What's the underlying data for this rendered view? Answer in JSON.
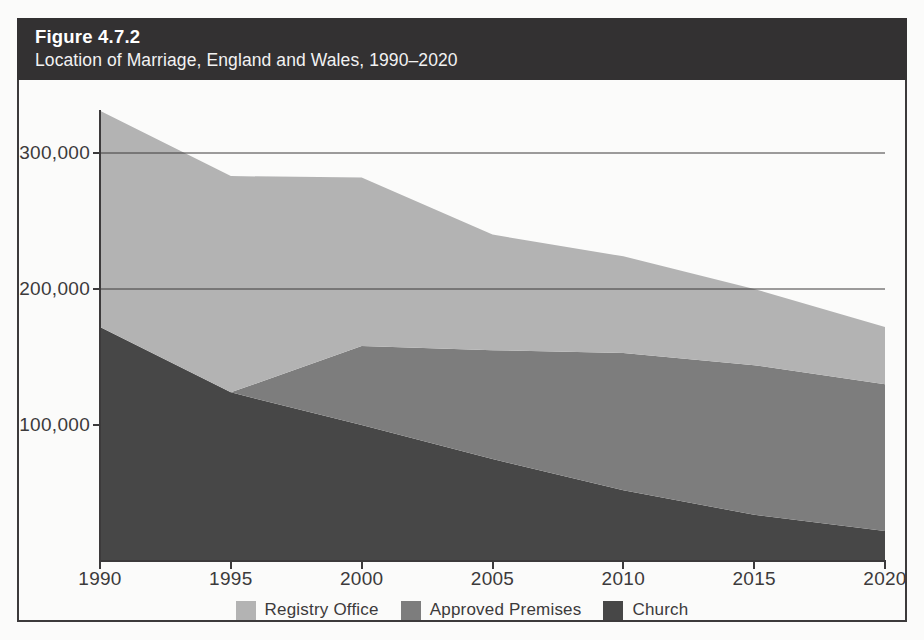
{
  "header": {
    "figure_number": "Figure 4.7.2",
    "subtitle": "Location of Marriage, England and Wales, 1990–2020"
  },
  "legend": {
    "items": [
      {
        "label": "Registry Office",
        "color": "#b3b3b3",
        "swatch_name": "legend-swatch-registry-office"
      },
      {
        "label": "Approved Premises",
        "color": "#7d7d7d",
        "swatch_name": "legend-swatch-approved-premises"
      },
      {
        "label": "Church",
        "color": "#474747",
        "swatch_name": "legend-swatch-church"
      }
    ]
  },
  "axes": {
    "y_ticks": [
      "100,000",
      "200,000",
      "300,000"
    ],
    "x_ticks": [
      "1990",
      "1995",
      "2000",
      "2005",
      "2010",
      "2015",
      "2020"
    ]
  },
  "chart_data": {
    "type": "area",
    "stacked": true,
    "title": "Figure 4.7.2",
    "subtitle": "Location of Marriage, England and Wales, 1990–2020",
    "xlabel": "",
    "ylabel": "",
    "x": [
      1990,
      1995,
      2000,
      2005,
      2010,
      2015,
      2020
    ],
    "xlim": [
      1990,
      2020
    ],
    "ylim": [
      0,
      340000
    ],
    "ytick_values": [
      100000,
      200000,
      300000
    ],
    "grid": false,
    "legend_position": "bottom-center",
    "series": [
      {
        "name": "Church",
        "color": "#474747",
        "values": [
          172000,
          124000,
          100000,
          75000,
          52000,
          34000,
          22000
        ]
      },
      {
        "name": "Approved Premises",
        "color": "#7d7d7d",
        "values": [
          0,
          0,
          58000,
          80000,
          101000,
          110000,
          108000
        ]
      },
      {
        "name": "Registry Office",
        "color": "#b3b3b3",
        "values": [
          159000,
          159000,
          124000,
          85000,
          71000,
          56000,
          42000
        ]
      }
    ],
    "totals": [
      331000,
      283000,
      282000,
      240000,
      224000,
      200000,
      172000
    ]
  }
}
